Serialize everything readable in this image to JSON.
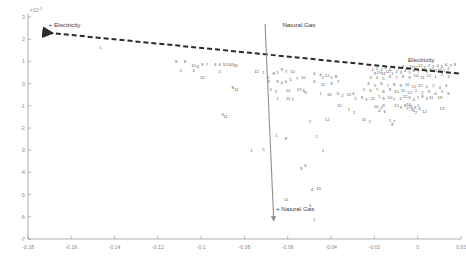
{
  "chart_data": {
    "type": "scatter",
    "title": "",
    "xlabel": "",
    "ylabel": "",
    "xlim": [
      -0.18,
      0.02
    ],
    "ylim": [
      -0.007,
      0.003
    ],
    "y_exponent_label": "×10",
    "y_exponent_sup": "-3",
    "grid": false,
    "legend_position": "none",
    "xticks": [
      -0.18,
      -0.16,
      -0.14,
      -0.12,
      -0.1,
      -0.08,
      -0.06,
      -0.04,
      -0.02,
      0,
      0.02
    ],
    "xticklabels": [
      "-0.18",
      "-0.16",
      "-0.14",
      "-0.12",
      "-0.1",
      "-0.08",
      "-0.06",
      "-0.04",
      "-0.02",
      "0",
      "0.02"
    ],
    "yticks": [
      3,
      2,
      1,
      0,
      -1,
      -2,
      -3,
      -4,
      -5,
      -6,
      -7
    ],
    "yticklabels": [
      "3",
      "2",
      "1",
      "0",
      "-1",
      "-2",
      "-3",
      "-4",
      "-5",
      "-6",
      "-7"
    ],
    "annotations": [
      {
        "name": "electricity-arrow-label",
        "text": "+ Electricity",
        "x": -0.1705,
        "y": 0.00253
      },
      {
        "name": "natural-gas-top-label",
        "text": "Natural Gas",
        "x": -0.0625,
        "y": 0.00257
      },
      {
        "name": "natural-gas-bottom-label",
        "text": "+ Natural Gas",
        "x": -0.0655,
        "y": -0.00575
      },
      {
        "name": "electricity-line-label",
        "text": "Electricity",
        "x": -0.0045,
        "y": 0.00098
      }
    ],
    "vectors": [
      {
        "name": "electricity-vector",
        "style": "dashed",
        "color": "#2b2b2b",
        "x1": 0.019,
        "y1": 0.00045,
        "x2": -0.1725,
        "y2": 0.00231,
        "arrow_at": "start"
      },
      {
        "name": "natural-gas-vector",
        "style": "solid",
        "color": "#8f8f8f",
        "x1": -0.0705,
        "y1": 0.00268,
        "x2": -0.0665,
        "y2": -0.00617,
        "arrow_at": "end"
      }
    ],
    "point_label_set": [
      "1",
      "2",
      "3",
      "4",
      "5",
      "6",
      "7",
      "8",
      "9",
      "10",
      "11",
      "12"
    ],
    "points": [
      {
        "l": "5",
        "x": -0.1465,
        "y": 0.00163
      },
      {
        "l": "8",
        "x": -0.1115,
        "y": 0.00098
      },
      {
        "l": "8",
        "x": -0.1075,
        "y": 0.00098
      },
      {
        "l": "10",
        "x": -0.1035,
        "y": 0.00081
      },
      {
        "l": "6",
        "x": -0.1015,
        "y": 0.00079
      },
      {
        "l": "9",
        "x": -0.0995,
        "y": 0.00087
      },
      {
        "l": "7",
        "x": -0.0975,
        "y": 0.00087
      },
      {
        "l": "4",
        "x": -0.0935,
        "y": 0.00087
      },
      {
        "l": "6",
        "x": -0.0915,
        "y": 0.00085
      },
      {
        "l": "9",
        "x": -0.0895,
        "y": 0.00085
      },
      {
        "l": "10",
        "x": -0.0875,
        "y": 0.00085
      },
      {
        "l": "11",
        "x": -0.0858,
        "y": 0.00085
      },
      {
        "l": "3",
        "x": -0.0845,
        "y": 0.00083
      },
      {
        "l": "1",
        "x": -0.0835,
        "y": 0.00083
      },
      {
        "l": "2",
        "x": -0.1095,
        "y": 0.00058
      },
      {
        "l": "4",
        "x": -0.1035,
        "y": 0.0006
      },
      {
        "l": "2",
        "x": -0.0915,
        "y": 0.00056
      },
      {
        "l": "11",
        "x": -0.0745,
        "y": 0.00054
      },
      {
        "l": "1",
        "x": -0.0712,
        "y": 0.0005
      },
      {
        "l": "12",
        "x": -0.0995,
        "y": 0.0003
      },
      {
        "l": "8",
        "x": -0.0855,
        "y": -0.00018
      },
      {
        "l": "11",
        "x": -0.0838,
        "y": -0.00027
      },
      {
        "l": "6",
        "x": -0.0692,
        "y": 0.0003
      },
      {
        "l": "8",
        "x": -0.0665,
        "y": 0.00048
      },
      {
        "l": "5",
        "x": -0.0648,
        "y": 0.00052
      },
      {
        "l": "9",
        "x": -0.0628,
        "y": 0.00062
      },
      {
        "l": "7",
        "x": -0.0608,
        "y": 0.00056
      },
      {
        "l": "10",
        "x": -0.0578,
        "y": 0.00056
      },
      {
        "l": "3",
        "x": -0.0688,
        "y": 8e-05
      },
      {
        "l": "9",
        "x": -0.0648,
        "y": 0.0001
      },
      {
        "l": "4",
        "x": -0.0628,
        "y": 6e-05
      },
      {
        "l": "6",
        "x": -0.0608,
        "y": 0.0001
      },
      {
        "l": "5",
        "x": -0.0588,
        "y": 0.00018
      },
      {
        "l": "7",
        "x": -0.0558,
        "y": 0.00022
      },
      {
        "l": "10",
        "x": -0.0528,
        "y": 0.00026
      },
      {
        "l": "5",
        "x": -0.0678,
        "y": -0.00028
      },
      {
        "l": "2",
        "x": -0.0655,
        "y": -0.00034
      },
      {
        "l": "10",
        "x": -0.0598,
        "y": -0.0003
      },
      {
        "l": "12",
        "x": -0.0548,
        "y": -0.00026
      },
      {
        "l": "3",
        "x": -0.0528,
        "y": -0.00032
      },
      {
        "l": "9",
        "x": -0.0518,
        "y": -0.0004
      },
      {
        "l": "1",
        "x": -0.0648,
        "y": -0.00066
      },
      {
        "l": "11",
        "x": -0.0598,
        "y": -0.00068
      },
      {
        "l": "7",
        "x": -0.0578,
        "y": -0.0007
      },
      {
        "l": "4",
        "x": -0.0478,
        "y": 0.00046
      },
      {
        "l": "6",
        "x": -0.0448,
        "y": 0.00042
      },
      {
        "l": "2",
        "x": -0.0438,
        "y": 0.00026
      },
      {
        "l": "12",
        "x": -0.0418,
        "y": 0.00038
      },
      {
        "l": "5",
        "x": -0.0398,
        "y": 0.0003
      },
      {
        "l": "8",
        "x": -0.0378,
        "y": 0.00034
      },
      {
        "l": "3",
        "x": -0.0478,
        "y": 8e-05
      },
      {
        "l": "11",
        "x": -0.0438,
        "y": -4e-05
      },
      {
        "l": "9",
        "x": -0.0398,
        "y": 2e-05
      },
      {
        "l": "7",
        "x": -0.0368,
        "y": 0.0001
      },
      {
        "l": "1",
        "x": -0.0448,
        "y": -0.00044
      },
      {
        "l": "10",
        "x": -0.0408,
        "y": -0.00048
      },
      {
        "l": "6",
        "x": -0.0368,
        "y": -0.00042
      },
      {
        "l": "2",
        "x": -0.0348,
        "y": -0.00054
      },
      {
        "l": "12",
        "x": -0.0318,
        "y": -0.0005
      },
      {
        "l": "4",
        "x": -0.0298,
        "y": -0.00044
      },
      {
        "l": "5",
        "x": -0.0288,
        "y": -0.00068
      },
      {
        "l": "8",
        "x": -0.0258,
        "y": -0.00062
      },
      {
        "l": "3",
        "x": -0.0238,
        "y": -0.0007
      },
      {
        "l": "11",
        "x": -0.0208,
        "y": -0.00066
      },
      {
        "l": "1",
        "x": -0.0178,
        "y": -0.00058
      },
      {
        "l": "9",
        "x": -0.0158,
        "y": -0.00066
      },
      {
        "l": "10",
        "x": -0.0128,
        "y": -0.00062
      },
      {
        "l": "7",
        "x": -0.0108,
        "y": -0.0007
      },
      {
        "l": "2",
        "x": -0.0078,
        "y": -0.00066
      },
      {
        "l": "12",
        "x": -0.0058,
        "y": -0.00058
      },
      {
        "l": "6",
        "x": -0.0038,
        "y": -0.00064
      },
      {
        "l": "4",
        "x": -0.0018,
        "y": -0.0007
      },
      {
        "l": "5",
        "x": 0.0002,
        "y": -0.00062
      },
      {
        "l": "8",
        "x": 0.0022,
        "y": -0.00058
      },
      {
        "l": "3",
        "x": 0.0042,
        "y": -0.00066
      },
      {
        "l": "11",
        "x": 0.0062,
        "y": -0.00062
      },
      {
        "l": "13",
        "x": 0.0102,
        "y": -0.0006
      },
      {
        "l": "1",
        "x": -0.0208,
        "y": 0.00066
      },
      {
        "l": "2",
        "x": -0.0188,
        "y": 0.0007
      },
      {
        "l": "3",
        "x": -0.0168,
        "y": 0.00064
      },
      {
        "l": "4",
        "x": -0.0148,
        "y": 0.00072
      },
      {
        "l": "5",
        "x": -0.0128,
        "y": 0.00066
      },
      {
        "l": "6",
        "x": -0.0108,
        "y": 0.00074
      },
      {
        "l": "7",
        "x": -0.0088,
        "y": 0.00068
      },
      {
        "l": "8",
        "x": -0.0068,
        "y": 0.00076
      },
      {
        "l": "9",
        "x": -0.0048,
        "y": 0.0007
      },
      {
        "l": "10",
        "x": -0.0028,
        "y": 0.00078
      },
      {
        "l": "11",
        "x": -0.0008,
        "y": 0.00072
      },
      {
        "l": "12",
        "x": 0.0012,
        "y": 0.0008
      },
      {
        "l": "1",
        "x": 0.0032,
        "y": 0.00074
      },
      {
        "l": "2",
        "x": 0.0052,
        "y": 0.00082
      },
      {
        "l": "3",
        "x": 0.0072,
        "y": 0.00076
      },
      {
        "l": "4",
        "x": 0.0092,
        "y": 0.00084
      },
      {
        "l": "5",
        "x": 0.0112,
        "y": 0.00078
      },
      {
        "l": "6",
        "x": 0.0132,
        "y": 0.00086
      },
      {
        "l": "7",
        "x": 0.0152,
        "y": 0.0008
      },
      {
        "l": "8",
        "x": 0.0172,
        "y": 0.00088
      },
      {
        "l": "9",
        "x": -0.0198,
        "y": 0.00048
      },
      {
        "l": "10",
        "x": -0.0178,
        "y": 0.00052
      },
      {
        "l": "11",
        "x": -0.0158,
        "y": 0.00046
      },
      {
        "l": "12",
        "x": -0.0138,
        "y": 0.00054
      },
      {
        "l": "1",
        "x": -0.0118,
        "y": 0.00048
      },
      {
        "l": "2",
        "x": -0.0098,
        "y": 0.00056
      },
      {
        "l": "3",
        "x": -0.0078,
        "y": 0.0005
      },
      {
        "l": "4",
        "x": -0.0058,
        "y": 0.00058
      },
      {
        "l": "5",
        "x": -0.0038,
        "y": 0.00052
      },
      {
        "l": "6",
        "x": -0.0018,
        "y": 0.0006
      },
      {
        "l": "7",
        "x": 0.0002,
        "y": 0.00054
      },
      {
        "l": "8",
        "x": 0.0022,
        "y": 0.00062
      },
      {
        "l": "9",
        "x": 0.0042,
        "y": 0.00056
      },
      {
        "l": "10",
        "x": 0.0062,
        "y": 0.00064
      },
      {
        "l": "11",
        "x": 0.0082,
        "y": 0.00058
      },
      {
        "l": "12",
        "x": 0.0102,
        "y": 0.00066
      },
      {
        "l": "1",
        "x": 0.0122,
        "y": 0.0006
      },
      {
        "l": "2",
        "x": 0.0142,
        "y": 0.00068
      },
      {
        "l": "3",
        "x": -0.0218,
        "y": 0.00026
      },
      {
        "l": "4",
        "x": -0.0188,
        "y": 0.0003
      },
      {
        "l": "5",
        "x": -0.0158,
        "y": 0.00024
      },
      {
        "l": "6",
        "x": -0.0128,
        "y": 0.00032
      },
      {
        "l": "7",
        "x": -0.0098,
        "y": 0.00026
      },
      {
        "l": "8",
        "x": -0.0068,
        "y": 0.00034
      },
      {
        "l": "9",
        "x": -0.0038,
        "y": 0.00028
      },
      {
        "l": "10",
        "x": -0.0008,
        "y": 0.00036
      },
      {
        "l": "11",
        "x": 0.0022,
        "y": 0.0003
      },
      {
        "l": "12",
        "x": 0.0052,
        "y": 0.00038
      },
      {
        "l": "1",
        "x": 0.0082,
        "y": 0.00032
      },
      {
        "l": "2",
        "x": 0.0112,
        "y": 0.0004
      },
      {
        "l": "3",
        "x": 0.0142,
        "y": 0.00034
      },
      {
        "l": "4",
        "x": -0.0228,
        "y": 2e-05
      },
      {
        "l": "5",
        "x": -0.0198,
        "y": -6e-05
      },
      {
        "l": "6",
        "x": -0.0168,
        "y": 0.0
      },
      {
        "l": "7",
        "x": -0.0138,
        "y": -8e-05
      },
      {
        "l": "8",
        "x": -0.0108,
        "y": -2e-05
      },
      {
        "l": "9",
        "x": -0.0078,
        "y": -0.0001
      },
      {
        "l": "10",
        "x": -0.0048,
        "y": -4e-05
      },
      {
        "l": "11",
        "x": -0.0018,
        "y": -0.00012
      },
      {
        "l": "12",
        "x": 0.0012,
        "y": -6e-05
      },
      {
        "l": "1",
        "x": 0.0042,
        "y": -0.00014
      },
      {
        "l": "2",
        "x": 0.0072,
        "y": -8e-05
      },
      {
        "l": "3",
        "x": 0.0102,
        "y": -0.00016
      },
      {
        "l": "4",
        "x": 0.0132,
        "y": -0.0001
      },
      {
        "l": "5",
        "x": -0.0248,
        "y": -0.00026
      },
      {
        "l": "6",
        "x": -0.0218,
        "y": -0.00032
      },
      {
        "l": "7",
        "x": -0.0188,
        "y": -0.00026
      },
      {
        "l": "8",
        "x": -0.0158,
        "y": -0.00034
      },
      {
        "l": "9",
        "x": -0.0128,
        "y": -0.00028
      },
      {
        "l": "10",
        "x": -0.0098,
        "y": -0.00036
      },
      {
        "l": "11",
        "x": -0.0068,
        "y": -0.0003
      },
      {
        "l": "12",
        "x": -0.0038,
        "y": -0.00038
      },
      {
        "l": "1",
        "x": -0.0008,
        "y": -0.00032
      },
      {
        "l": "2",
        "x": 0.0022,
        "y": -0.0004
      },
      {
        "l": "3",
        "x": 0.0052,
        "y": -0.00034
      },
      {
        "l": "4",
        "x": 0.0082,
        "y": -0.00042
      },
      {
        "l": "5",
        "x": 0.0112,
        "y": -0.00036
      },
      {
        "l": "6",
        "x": 0.0142,
        "y": -0.00044
      },
      {
        "l": "12",
        "x": -0.0362,
        "y": -0.001
      },
      {
        "l": "1",
        "x": -0.0318,
        "y": -0.00118
      },
      {
        "l": "2",
        "x": -0.0295,
        "y": -0.0013
      },
      {
        "l": "10",
        "x": -0.0192,
        "y": -0.00104
      },
      {
        "l": "5",
        "x": -0.0168,
        "y": -0.00108
      },
      {
        "l": "9",
        "x": -0.0158,
        "y": -0.001
      },
      {
        "l": "4",
        "x": -0.0178,
        "y": -0.00122
      },
      {
        "l": "6",
        "x": -0.0152,
        "y": -0.00124
      },
      {
        "l": "12",
        "x": -0.0098,
        "y": -0.001
      },
      {
        "l": "9",
        "x": -0.0078,
        "y": -0.00106
      },
      {
        "l": "8",
        "x": -0.0058,
        "y": -0.00098
      },
      {
        "l": "7",
        "x": -0.0048,
        "y": -0.00112
      },
      {
        "l": "10",
        "x": -0.0042,
        "y": -0.00094
      },
      {
        "l": "11",
        "x": -0.0032,
        "y": -0.00104
      },
      {
        "l": "3",
        "x": -0.0028,
        "y": -0.00116
      },
      {
        "l": "5",
        "x": -0.0018,
        "y": -0.00122
      },
      {
        "l": "6",
        "x": -0.0012,
        "y": -0.00108
      },
      {
        "l": "2",
        "x": -0.0008,
        "y": -0.0013
      },
      {
        "l": "1",
        "x": 0.0002,
        "y": -0.001
      },
      {
        "l": "4",
        "x": 0.0008,
        "y": -0.00112
      },
      {
        "l": "12",
        "x": 0.0032,
        "y": -0.00124
      },
      {
        "l": "13",
        "x": 0.0112,
        "y": -0.0011
      },
      {
        "l": "1",
        "x": -0.0498,
        "y": -0.00168
      },
      {
        "l": "12",
        "x": -0.0418,
        "y": -0.00162
      },
      {
        "l": "11",
        "x": -0.0248,
        "y": -0.0016
      },
      {
        "l": "2",
        "x": -0.0222,
        "y": -0.00172
      },
      {
        "l": "8",
        "x": -0.0118,
        "y": -0.00182
      },
      {
        "l": "1",
        "x": -0.0128,
        "y": -0.00166
      },
      {
        "l": "7",
        "x": -0.0108,
        "y": -0.0017
      },
      {
        "l": "1",
        "x": -0.0652,
        "y": -0.00232
      },
      {
        "l": "8",
        "x": -0.0608,
        "y": -0.00246
      },
      {
        "l": "2",
        "x": -0.0468,
        "y": -0.0024
      },
      {
        "l": "1",
        "x": -0.0438,
        "y": -0.003
      },
      {
        "l": "9",
        "x": -0.0538,
        "y": -0.0038
      },
      {
        "l": "6",
        "x": -0.0518,
        "y": -0.0037
      },
      {
        "l": "4",
        "x": -0.0488,
        "y": -0.00478
      },
      {
        "l": "10",
        "x": -0.0458,
        "y": -0.00472
      },
      {
        "l": "11",
        "x": -0.0608,
        "y": -0.0052
      },
      {
        "l": "3",
        "x": -0.0498,
        "y": -0.00548
      },
      {
        "l": "2",
        "x": -0.0478,
        "y": -0.00612
      },
      {
        "l": "1",
        "x": -0.0768,
        "y": -0.003
      },
      {
        "l": "5",
        "x": -0.0712,
        "y": -0.00298
      },
      {
        "l": "3",
        "x": -0.0902,
        "y": -0.0014
      },
      {
        "l": "11",
        "x": -0.0888,
        "y": -0.00148
      }
    ]
  }
}
